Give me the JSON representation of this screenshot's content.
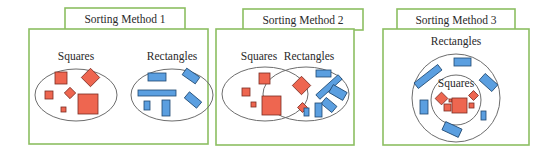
{
  "colors": {
    "frame": "#8cbf62",
    "square_fill": "#ee6650",
    "square_stroke": "#7a2c22",
    "rect_fill": "#5b9fe0",
    "rect_stroke": "#1f4870",
    "ellipse_stroke": "#6d6d6d"
  },
  "panels": [
    {
      "title": "Sorting Method 1",
      "groups": [
        {
          "label": "Squares"
        },
        {
          "label": "Rectangles"
        }
      ],
      "description": "Squares and rectangles sorted into two separate, non-overlapping sets."
    },
    {
      "title": "Sorting Method 2",
      "groups": [
        {
          "label": "Squares"
        },
        {
          "label": "Rectangles"
        }
      ],
      "description": "Squares and rectangles as overlapping sets; squares (rotated) appear in the intersection."
    },
    {
      "title": "Sorting Method 3",
      "groups": [
        {
          "label": "Rectangles"
        },
        {
          "label": "Squares"
        }
      ],
      "description": "Squares set nested inside the rectangles set."
    }
  ]
}
